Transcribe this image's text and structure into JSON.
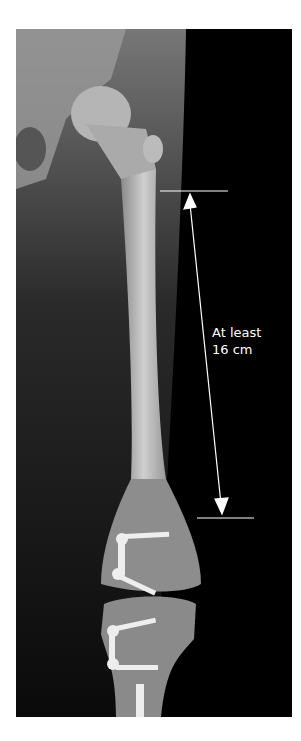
{
  "image": {
    "description": "Radiograph of femur and knee with epiphysiodesis plates and screws",
    "annotation": {
      "line1": "At least",
      "line2": "16 cm"
    },
    "colors": {
      "background": "#000000",
      "bone": "#cfcfcf",
      "annotation": "#ffffff",
      "page": "#ffffff"
    }
  }
}
